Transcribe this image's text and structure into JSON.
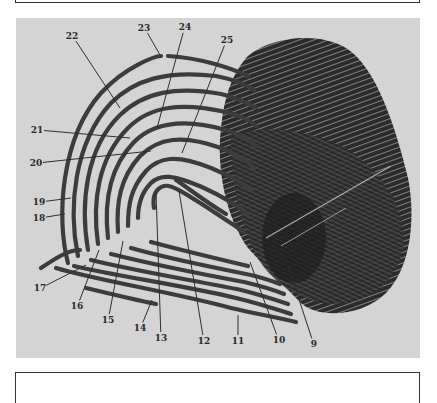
{
  "figure": {
    "panel_background": "#d4d4d4",
    "ridge_color": "#3c3c3c",
    "leader_color": "#2e2e2e",
    "callouts": [
      {
        "id": "9",
        "label": "9",
        "lx": 298,
        "ly": 326,
        "px": 272,
        "py": 248
      },
      {
        "id": "10",
        "label": "10",
        "lx": 263,
        "ly": 322,
        "px": 234,
        "py": 244
      },
      {
        "id": "11",
        "label": "11",
        "lx": 222,
        "ly": 323,
        "px": 222,
        "py": 297
      },
      {
        "id": "12",
        "label": "12",
        "lx": 188,
        "ly": 323,
        "px": 163,
        "py": 173
      },
      {
        "id": "13",
        "label": "13",
        "lx": 145,
        "ly": 320,
        "px": 140,
        "py": 174
      },
      {
        "id": "14",
        "label": "14",
        "lx": 124,
        "ly": 310,
        "px": 136,
        "py": 282
      },
      {
        "id": "15",
        "label": "15",
        "lx": 92,
        "ly": 302,
        "px": 107,
        "py": 223
      },
      {
        "id": "16",
        "label": "16",
        "lx": 61,
        "ly": 288,
        "px": 83,
        "py": 232
      },
      {
        "id": "17",
        "label": "17",
        "lx": 24,
        "ly": 270,
        "px": 70,
        "py": 247
      },
      {
        "id": "18",
        "label": "18",
        "lx": 23,
        "ly": 200,
        "px": 49,
        "py": 196
      },
      {
        "id": "19",
        "label": "19",
        "lx": 23,
        "ly": 184,
        "px": 55,
        "py": 180
      },
      {
        "id": "20",
        "label": "20",
        "lx": 20,
        "ly": 145,
        "px": 135,
        "py": 133
      },
      {
        "id": "21",
        "label": "21",
        "lx": 21,
        "ly": 112,
        "px": 114,
        "py": 120
      },
      {
        "id": "22",
        "label": "22",
        "lx": 56,
        "ly": 18,
        "px": 104,
        "py": 90
      },
      {
        "id": "23",
        "label": "23",
        "lx": 128,
        "ly": 10,
        "px": 144,
        "py": 37
      },
      {
        "id": "24",
        "label": "24",
        "lx": 169,
        "ly": 9,
        "px": 141,
        "py": 110
      },
      {
        "id": "25",
        "label": "25",
        "lx": 211,
        "ly": 22,
        "px": 166,
        "py": 135
      }
    ]
  }
}
